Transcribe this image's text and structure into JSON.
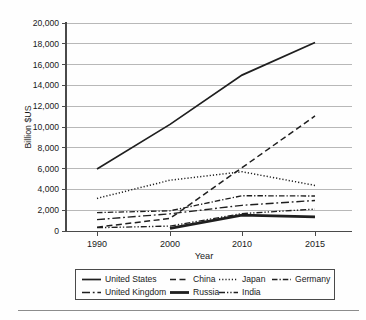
{
  "chart_data": {
    "type": "line",
    "title": "",
    "xlabel": "Year",
    "ylabel": "Billion $US",
    "x_categories": [
      "1990",
      "2000",
      "2010",
      "2015"
    ],
    "ylim": [
      0,
      20000
    ],
    "ytick_step": 2000,
    "ytick_labels": [
      "0",
      "2,000",
      "4,000",
      "6,000",
      "8,000",
      "10,000",
      "12,000",
      "14,000",
      "16,000",
      "18,000",
      "20,000"
    ],
    "grid": "horizontal-on",
    "line_color": "#1f1f1f",
    "grid_color": "#b8b8b8",
    "axis_color": "#4a4a4a",
    "legend_position": "bottom-box",
    "legend_rows": [
      [
        "United States",
        "China",
        "Japan",
        "Germany"
      ],
      [
        "United Kingdom",
        "Russia",
        "India"
      ]
    ],
    "series": [
      {
        "name": "United States",
        "style": "solid",
        "values": [
          5963,
          10252,
          14992,
          18121
        ]
      },
      {
        "name": "China",
        "style": "dashed",
        "values": [
          361,
          1211,
          6087,
          11065
        ]
      },
      {
        "name": "Japan",
        "style": "dotted",
        "values": [
          3133,
          4888,
          5700,
          4389
        ]
      },
      {
        "name": "Germany",
        "style": "dashdot",
        "values": [
          1765,
          1943,
          3396,
          3365
        ]
      },
      {
        "name": "United Kingdom",
        "style": "longdashdot",
        "values": [
          1093,
          1658,
          2475,
          2928
        ]
      },
      {
        "name": "Russia",
        "style": "thicksolid",
        "values": [
          null,
          260,
          1525,
          1356
        ]
      },
      {
        "name": "India",
        "style": "dashdotdot",
        "values": [
          321,
          468,
          1676,
          2104
        ]
      }
    ]
  }
}
